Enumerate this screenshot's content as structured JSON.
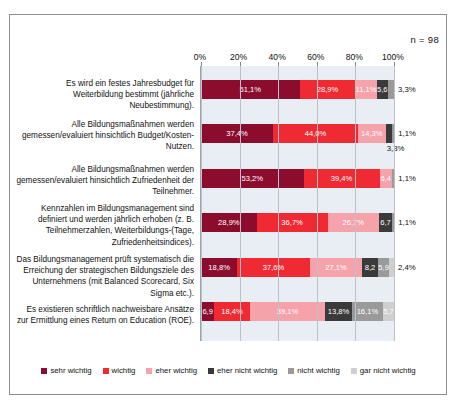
{
  "sample_note": "n = 98",
  "legend": {
    "items": [
      {
        "label": "sehr wichtig",
        "color": "#8c0c2e"
      },
      {
        "label": "wichtig",
        "color": "#ef2a33"
      },
      {
        "label": "eher wichtig",
        "color": "#f6a2ab"
      },
      {
        "label": "eher nicht wichtig",
        "color": "#3a3a3a"
      },
      {
        "label": "nicht wichtig",
        "color": "#9a9a9a"
      },
      {
        "label": "gar nicht wichtig",
        "color": "#cfcfcf"
      }
    ]
  },
  "chart_data": {
    "type": "bar",
    "orientation": "horizontal",
    "stacked": true,
    "title": "",
    "subtitle": "",
    "xlabel": "",
    "ylabel": "",
    "xlim": [
      0,
      100
    ],
    "xticks": [
      "0%",
      "20%",
      "40%",
      "60%",
      "80%",
      "100%"
    ],
    "xtick_values": [
      0,
      20,
      40,
      60,
      80,
      100
    ],
    "grid": true,
    "legend_position": "bottom",
    "annotation": "n = 98",
    "categories": [
      "Es wird ein festes Jahresbudget für Weiterbildung bestimmt (jährliche Neubestimmung).",
      "Alle Bildungsmaßnahmen werden gemessen/evaluiert hinsichtlich Budget/Kosten-Nutzen.",
      "Alle Bildungsmaßnahmen werden gemessen/evaluiert hinsichtlich Zufriedenheit der Teilnehmer.",
      "Kennzahlen im Bildungsmanagement sind definiert und werden jährlich erhoben (z. B. Teilnehmerzahlen, Weiterbildungs-(Tage, Zufriedenheitsindices).",
      "Das Bildungsmanagement prüft systematisch die Erreichung der strategischen Bildungsziele des Unternehmens (mit Balanced Scorecard, Six Sigma etc.).",
      "Es existieren schriftlich nachweisbare Ansätze zur Ermittlung eines Return on Education (ROE)."
    ],
    "series": [
      {
        "name": "sehr wichtig",
        "color": "#8c0c2e",
        "values": [
          51.1,
          37.4,
          53.2,
          28.9,
          18.8,
          6.9
        ]
      },
      {
        "name": "wichtig",
        "color": "#ef2a33",
        "values": [
          28.9,
          44.0,
          39.4,
          36.7,
          37.6,
          18.4
        ]
      },
      {
        "name": "eher wichtig",
        "color": "#f6a2ab",
        "values": [
          11.1,
          14.3,
          6.4,
          26.7,
          27.1,
          39.1
        ]
      },
      {
        "name": "eher nicht wichtig",
        "color": "#3a3a3a",
        "values": [
          5.6,
          3.3,
          0.0,
          6.7,
          8.2,
          13.8
        ]
      },
      {
        "name": "nicht wichtig",
        "color": "#9a9a9a",
        "values": [
          3.3,
          1.1,
          1.1,
          1.1,
          5.9,
          16.1
        ]
      },
      {
        "name": "gar nicht wichtig",
        "color": "#cfcfcf",
        "values": [
          0.0,
          0.0,
          0.0,
          0.0,
          2.4,
          5.7
        ]
      }
    ],
    "rows": [
      {
        "label": "Es wird ein festes Jahresbudget für Weiterbildung bestimmt (jährliche Neubestimmung).",
        "segments": [
          {
            "series": "sehr wichtig",
            "value": 51.1,
            "text": "51,1%",
            "placement": "inside"
          },
          {
            "series": "wichtig",
            "value": 28.9,
            "text": "28,9%",
            "placement": "inside"
          },
          {
            "series": "eher wichtig",
            "value": 11.1,
            "text": "11,1%",
            "placement": "inside"
          },
          {
            "series": "eher nicht wichtig",
            "value": 5.6,
            "text": "5,6",
            "placement": "inside"
          },
          {
            "series": "nicht wichtig",
            "value": 3.3,
            "text": "3,3%",
            "placement": "outside"
          }
        ]
      },
      {
        "label": "Alle Bildungsmaßnahmen werden gemessen/evaluiert hinsichtlich Budget/Kosten-Nutzen.",
        "segments": [
          {
            "series": "sehr wichtig",
            "value": 37.4,
            "text": "37,4%",
            "placement": "inside"
          },
          {
            "series": "wichtig",
            "value": 44.0,
            "text": "44,0%",
            "placement": "inside"
          },
          {
            "series": "eher wichtig",
            "value": 14.3,
            "text": "14,3%",
            "placement": "inside"
          },
          {
            "series": "eher nicht wichtig",
            "value": 3.3,
            "text": "3,3%",
            "placement": "below"
          },
          {
            "series": "nicht wichtig",
            "value": 1.1,
            "text": "1,1%",
            "placement": "outside"
          }
        ]
      },
      {
        "label": "Alle Bildungsmaßnahmen werden gemessen/evaluiert hinsichtlich Zufriedenheit der Teilnehmer.",
        "segments": [
          {
            "series": "sehr wichtig",
            "value": 53.2,
            "text": "53,2%",
            "placement": "inside"
          },
          {
            "series": "wichtig",
            "value": 39.4,
            "text": "39,4%",
            "placement": "inside"
          },
          {
            "series": "eher wichtig",
            "value": 6.4,
            "text": "6,4",
            "placement": "inside"
          },
          {
            "series": "nicht wichtig",
            "value": 1.1,
            "text": "1,1%",
            "placement": "outside"
          }
        ]
      },
      {
        "label": "Kennzahlen im Bildungsmanagement sind definiert und werden jährlich erhoben (z. B. Teilnehmerzahlen, Weiterbildungs-(Tage, Zufriedenheitsindices).",
        "segments": [
          {
            "series": "sehr wichtig",
            "value": 28.9,
            "text": "28,9%",
            "placement": "inside"
          },
          {
            "series": "wichtig",
            "value": 36.7,
            "text": "36,7%",
            "placement": "inside"
          },
          {
            "series": "eher wichtig",
            "value": 26.7,
            "text": "26,7%",
            "placement": "inside"
          },
          {
            "series": "eher nicht wichtig",
            "value": 6.7,
            "text": "6,7",
            "placement": "inside"
          },
          {
            "series": "nicht wichtig",
            "value": 1.1,
            "text": "1,1%",
            "placement": "outside"
          }
        ]
      },
      {
        "label": "Das Bildungsmanagement prüft systematisch die Erreichung der strategischen Bildungsziele des Unternehmens (mit Balanced Scorecard, Six Sigma etc.).",
        "segments": [
          {
            "series": "sehr wichtig",
            "value": 18.8,
            "text": "18,8%",
            "placement": "inside"
          },
          {
            "series": "wichtig",
            "value": 37.6,
            "text": "37,6%",
            "placement": "inside"
          },
          {
            "series": "eher wichtig",
            "value": 27.1,
            "text": "27,1%",
            "placement": "inside"
          },
          {
            "series": "eher nicht wichtig",
            "value": 8.2,
            "text": "8,2",
            "placement": "inside"
          },
          {
            "series": "nicht wichtig",
            "value": 5.9,
            "text": "5,9",
            "placement": "inside"
          },
          {
            "series": "gar nicht wichtig",
            "value": 2.4,
            "text": "2,4%",
            "placement": "outside"
          }
        ]
      },
      {
        "label": "Es existieren schriftlich nachweisbare Ansätze zur Ermittlung eines Return on Education (ROE).",
        "segments": [
          {
            "series": "sehr wichtig",
            "value": 6.9,
            "text": "6,9",
            "placement": "inside"
          },
          {
            "series": "wichtig",
            "value": 18.4,
            "text": "18,4%",
            "placement": "inside"
          },
          {
            "series": "eher wichtig",
            "value": 39.1,
            "text": "39,1%",
            "placement": "inside"
          },
          {
            "series": "eher nicht wichtig",
            "value": 13.8,
            "text": "13,8%",
            "placement": "inside"
          },
          {
            "series": "nicht wichtig",
            "value": 16.1,
            "text": "16,1%",
            "placement": "inside"
          },
          {
            "series": "gar nicht wichtig",
            "value": 5.7,
            "text": "5,7",
            "placement": "inside"
          }
        ]
      }
    ]
  }
}
